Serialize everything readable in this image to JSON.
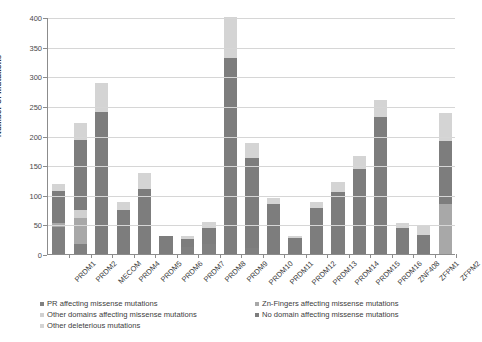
{
  "chart_data": {
    "type": "bar",
    "stacked": true,
    "title": "",
    "xlabel": "",
    "ylabel": "Number of mutations",
    "ylim": [
      0,
      400
    ],
    "ytick_step": 50,
    "yticks": [
      "0",
      "50",
      "100",
      "150",
      "200",
      "250",
      "300",
      "350",
      "400"
    ],
    "grid": true,
    "legend_position": "bottom",
    "categories": [
      "PRDM1",
      "PRDM2",
      "MECOM",
      "PRDM4",
      "PRDM5",
      "PRDM6",
      "PRDM7",
      "PRDM8",
      "PRDM9",
      "PRDM10",
      "PRDM11",
      "PRDM12",
      "PRDM13",
      "PRDM14",
      "PRDM15",
      "PRDM16",
      "ZNF408",
      "ZFPM1",
      "ZFPM2"
    ],
    "series": [
      {
        "name": "PR affecting missense mutations",
        "color": "#808080",
        "values": [
          45,
          17,
          0,
          0,
          0,
          0,
          11,
          17,
          0,
          10,
          0,
          0,
          0,
          0,
          0,
          0,
          0,
          0,
          0
        ]
      },
      {
        "name": "Zn-Fingers affecting missense mutations",
        "color": "#a8a8a8",
        "values": [
          8,
          43,
          0,
          0,
          0,
          0,
          0,
          0,
          0,
          0,
          0,
          0,
          0,
          0,
          0,
          0,
          0,
          0,
          85
        ]
      },
      {
        "name": "Other domains affecting missense mutations",
        "color": "#d0d0d0",
        "values": [
          0,
          15,
          0,
          0,
          0,
          0,
          0,
          0,
          0,
          0,
          0,
          0,
          0,
          0,
          0,
          0,
          0,
          0,
          0
        ]
      },
      {
        "name": "No domain affecting missense mutations",
        "color": "#7d7d7d",
        "values": [
          54,
          118,
          240,
          74,
          110,
          30,
          14,
          27,
          330,
          152,
          84,
          27,
          78,
          104,
          143,
          232,
          44,
          32,
          106
        ]
      },
      {
        "name": "Other deleterious mutations",
        "color": "#d4d4d4",
        "values": [
          12,
          29,
          48,
          14,
          26,
          0,
          6,
          10,
          70,
          25,
          11,
          3,
          10,
          18,
          22,
          28,
          8,
          15,
          47
        ]
      }
    ],
    "totals": [
      119,
      222,
      288,
      88,
      136,
      30,
      31,
      54,
      400,
      187,
      95,
      30,
      88,
      122,
      165,
      260,
      52,
      47,
      238
    ]
  },
  "legend": {
    "left_items": [
      "PR affecting missense mutations",
      "Other domains affecting missense mutations",
      "Other deleterious mutations"
    ],
    "right_items": [
      "Zn-Fingers affecting missense mutations",
      "No domain affecting missense mutations"
    ]
  }
}
